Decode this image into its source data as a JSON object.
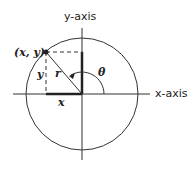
{
  "diagram": {
    "y_axis_label": "y-axis",
    "x_axis_label": "x-axis",
    "point_label": "(x, y)",
    "radius_label": "r",
    "angle_label": "θ",
    "x_label": "x",
    "y_label": "y"
  }
}
